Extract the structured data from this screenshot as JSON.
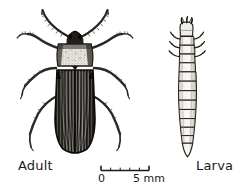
{
  "figure": {
    "type": "scientific-illustration",
    "background_color": "#ffffff",
    "ink_color": "#1a1a1a",
    "width": 246,
    "height": 191
  },
  "specimens": [
    {
      "id": "adult",
      "label": "Adult",
      "description": "dorsal view of adult beetle with striated elytra, pale stippled pronotum, dark head, two elbowed antennae and six legs"
    },
    {
      "id": "larva",
      "label": "Larva",
      "description": "dorsal view of elongate segmented beetle larva with dark head capsule, three pairs of thoracic legs and tapering abdomen"
    }
  ],
  "scale_bar": {
    "name": "scale-bar",
    "min_label": "0",
    "max_label": "5 mm",
    "min_value": 0,
    "max_value": 5,
    "units": "mm",
    "minor_ticks": 5,
    "length_px": 48
  }
}
